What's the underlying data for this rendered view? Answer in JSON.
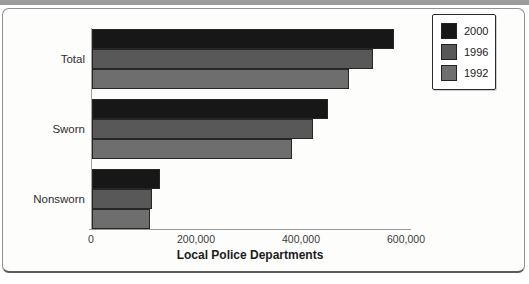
{
  "figure": {
    "top_strip_color": "#9b9b9b",
    "panel_bg": "#fdfdfc",
    "panel_border_color": "#8f8f8f"
  },
  "chart_data": {
    "type": "bar",
    "orientation": "horizontal",
    "title": "",
    "xlabel": "Local Police Departments",
    "ylabel": "",
    "categories": [
      "Total",
      "Sworn",
      "Nonsworn"
    ],
    "series": [
      {
        "name": "2000",
        "color": "#171717",
        "values": [
          575000,
          450000,
          130000
        ]
      },
      {
        "name": "1996",
        "color": "#585858",
        "values": [
          535000,
          420000,
          115000
        ]
      },
      {
        "name": "1992",
        "color": "#6e6e6e",
        "values": [
          490000,
          380000,
          110000
        ]
      }
    ],
    "xlim": [
      0,
      600000
    ],
    "xticks": [
      0,
      200000,
      400000,
      600000
    ],
    "xtick_labels": [
      "0",
      "200,000",
      "400,000",
      "600,000"
    ],
    "grid": false,
    "legend_position": "top-right",
    "legend_entries": [
      "2000",
      "1996",
      "1992"
    ]
  }
}
